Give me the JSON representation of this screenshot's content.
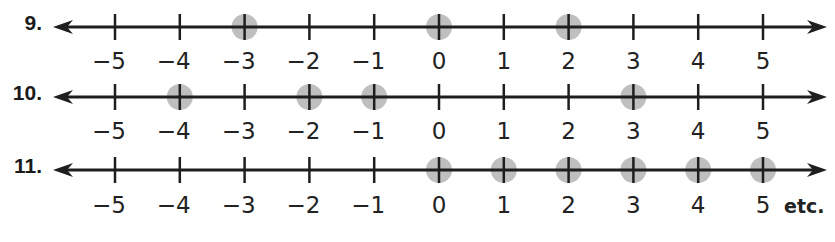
{
  "colors": {
    "line": "#1e1e1e",
    "highlight": "#b4b4b4",
    "text": "#222222"
  },
  "axis": {
    "ticks": [
      -5,
      -4,
      -3,
      -2,
      -1,
      0,
      1,
      2,
      3,
      4,
      5
    ],
    "tick_labels": [
      "−5",
      "−4",
      "−3",
      "−2",
      "−1",
      "0",
      "1",
      "2",
      "3",
      "4",
      "5"
    ],
    "x_of_minus5": 115,
    "spacing": 64.8,
    "arrow_left_x": 53,
    "arrow_right_x": 827
  },
  "problems": [
    {
      "number": "9.",
      "line_y": 27,
      "label_y": 63,
      "highlighted": [
        -3,
        0,
        2
      ],
      "suffix": ""
    },
    {
      "number": "10.",
      "line_y": 97,
      "label_y": 133,
      "highlighted": [
        -4,
        -2,
        -1,
        3
      ],
      "suffix": ""
    },
    {
      "number": "11.",
      "line_y": 170,
      "label_y": 207,
      "highlighted": [
        0,
        1,
        2,
        3,
        4,
        5
      ],
      "suffix": "etc."
    }
  ],
  "chart_data": {
    "type": "number-line",
    "title": "",
    "xlabel": "",
    "ylabel": "",
    "xlim": [
      -5,
      5
    ],
    "tick_labels": [
      "-5",
      "-4",
      "-3",
      "-2",
      "-1",
      "0",
      "1",
      "2",
      "3",
      "4",
      "5"
    ],
    "series": [
      {
        "name": "9.",
        "points": [
          -3,
          0,
          2
        ]
      },
      {
        "name": "10.",
        "points": [
          -4,
          -2,
          -1,
          3
        ]
      },
      {
        "name": "11.",
        "points": [
          0,
          1,
          2,
          3,
          4,
          5
        ],
        "annotation": "etc."
      }
    ]
  }
}
